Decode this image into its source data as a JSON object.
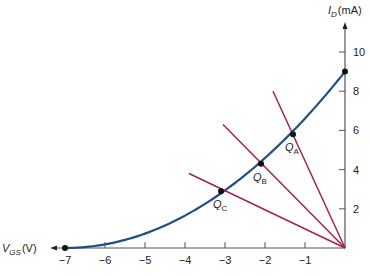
{
  "chart_data": {
    "type": "line",
    "title": "",
    "xlabel": "V_GS (V)",
    "ylabel": "I_D (mA)",
    "x_axis": {
      "label_main": "V",
      "label_sub": "GS",
      "label_unit": "(V)",
      "ticks": [
        -7,
        -6,
        -5,
        -4,
        -3,
        -2,
        -1
      ],
      "range": [
        -7,
        0
      ]
    },
    "y_axis": {
      "label_main": "I",
      "label_sub": "D",
      "label_unit": "(mA)",
      "ticks": [
        2,
        4,
        6,
        8,
        10
      ],
      "range": [
        0,
        10.5
      ]
    },
    "grid": false,
    "transfer_curve": {
      "name": "JFET transfer characteristic",
      "IDSS_mA": 9,
      "VGS_off_V": -7,
      "color": "#1f4e86",
      "endpoints": [
        {
          "x": -7,
          "y": 0
        },
        {
          "x": 0,
          "y": 9
        }
      ]
    },
    "bias_lines": {
      "color": "#a3224f",
      "origin": {
        "x": 0,
        "y": 0
      },
      "lines": [
        {
          "name": "A",
          "start": {
            "x": -1.8,
            "y": 8.0
          }
        },
        {
          "name": "B",
          "start": {
            "x": -3.05,
            "y": 6.3
          }
        },
        {
          "name": "C",
          "start": {
            "x": -3.9,
            "y": 3.8
          }
        }
      ]
    },
    "q_points": [
      {
        "label_main": "Q",
        "label_sub": "A",
        "x": -1.3,
        "y": 5.8
      },
      {
        "label_main": "Q",
        "label_sub": "B",
        "x": -2.1,
        "y": 4.3
      },
      {
        "label_main": "Q",
        "label_sub": "C",
        "x": -3.1,
        "y": 2.9
      }
    ]
  }
}
